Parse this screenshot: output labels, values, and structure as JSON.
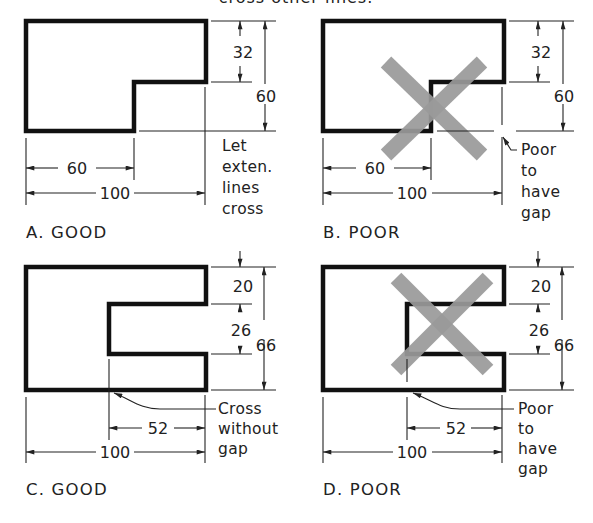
{
  "header": {
    "partial_text": "cross other lines."
  },
  "colors": {
    "object_line": "#111111",
    "dimension_line": "#222222",
    "x_mark": "#9a9a9a",
    "background": "#ffffff"
  },
  "panels": [
    {
      "id": "A",
      "caption": "A.  GOOD",
      "dims": {
        "top_step": "32",
        "height": "60",
        "partial_width": "60",
        "total_width": "100"
      },
      "note": [
        "Let",
        "exten.",
        "lines",
        "cross"
      ],
      "x_mark": false
    },
    {
      "id": "B",
      "caption": "B.  POOR",
      "dims": {
        "top_step": "32",
        "height": "60",
        "partial_width": "60",
        "total_width": "100"
      },
      "note": [
        "Poor",
        "to",
        "have",
        "gap"
      ],
      "x_mark": true
    },
    {
      "id": "C",
      "caption": "C.  GOOD",
      "dims": {
        "top": "20",
        "slot": "26",
        "height": "66",
        "partial_width": "52",
        "total_width": "100"
      },
      "note": [
        "Cross",
        "without",
        "gap"
      ],
      "x_mark": false
    },
    {
      "id": "D",
      "caption": "D.  POOR",
      "dims": {
        "top": "20",
        "slot": "26",
        "height": "66",
        "partial_width": "52",
        "total_width": "100"
      },
      "note": [
        "Poor",
        "to",
        "have",
        "gap"
      ],
      "x_mark": true
    }
  ]
}
